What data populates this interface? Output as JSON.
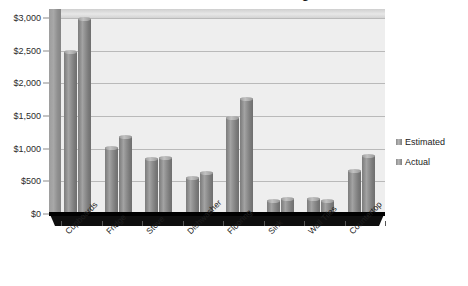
{
  "chart_data": {
    "type": "bar",
    "title": "Kitchen Renovation Budget",
    "xlabel": "",
    "ylabel": "",
    "ylim": [
      0,
      3000
    ],
    "ytick_step": 500,
    "ytick_labels": [
      "$0",
      "$500",
      "$1,000",
      "$1,500",
      "$2,000",
      "$2,500",
      "$3,000"
    ],
    "ytick_values": [
      0,
      500,
      1000,
      1500,
      2000,
      2500,
      3000
    ],
    "grid": true,
    "legend_position": "right",
    "style": "3d-cylinder-clustered-column",
    "categories": [
      "Cupboards",
      "Fridge",
      "Stove",
      "Dishwasher",
      "Flooring",
      "Sink",
      "Wall Tiles",
      "Countertop"
    ],
    "series": [
      {
        "name": "Estimated",
        "color": "#8a8a8a",
        "values": [
          2500,
          1020,
          850,
          570,
          1480,
          215,
          250,
          670
        ]
      },
      {
        "name": "Actual",
        "color": "#8a8a8a",
        "values": [
          3000,
          1200,
          880,
          640,
          1780,
          250,
          210,
          900
        ]
      }
    ]
  },
  "legend": {
    "items": [
      {
        "label": "Estimated"
      },
      {
        "label": "Actual"
      }
    ]
  },
  "colors": {
    "plot_background": "#eeeeee",
    "gridline": "#b9b9b9",
    "floor": "#0e0e0e",
    "wall": "#9d9d9d",
    "bar": "#8a8a8a",
    "text": "#1f1f1f"
  }
}
